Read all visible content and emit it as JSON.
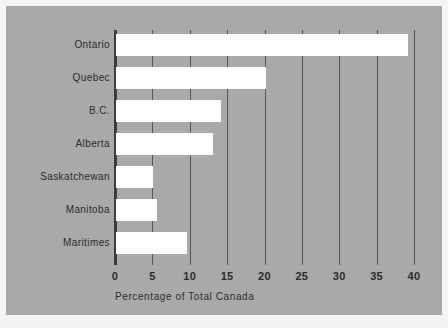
{
  "chart_data": {
    "type": "bar",
    "orientation": "horizontal",
    "title": "",
    "xlabel": "Percentage of Total Canada",
    "ylabel": "",
    "categories": [
      "Ontario",
      "Quebec",
      "B.C.",
      "Alberta",
      "Saskatchewan",
      "Manitoba",
      "Maritimes"
    ],
    "values": [
      39,
      20,
      14,
      13,
      5,
      5.5,
      9.5
    ],
    "xlim": [
      0,
      40
    ],
    "xticks": [
      0,
      5,
      10,
      15,
      20,
      25,
      30,
      35,
      40
    ],
    "xtick_labels": [
      "0",
      "5",
      "10",
      "15",
      "20",
      "25",
      "30",
      "35",
      "40"
    ],
    "grid": "vertical",
    "legend": "none",
    "colors": {
      "panel_background": "#a9a9a9",
      "page_background": "#f4f4f4",
      "bar_fill": "#fdfdfd",
      "gridline": "#55565a",
      "axis_line": "#3b3c3f",
      "text": "#2a2b2e"
    }
  }
}
